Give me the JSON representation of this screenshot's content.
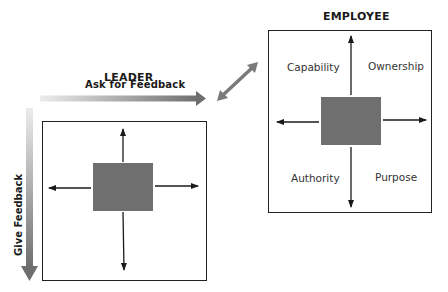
{
  "leader": {
    "title": "LEADER",
    "horizontal_arrow_label": "Ask for Feedback",
    "vertical_arrow_label": "Give Feedback"
  },
  "employee": {
    "title": "EMPLOYEE",
    "quadrants": {
      "top_left": "Capability",
      "top_right": "Ownership",
      "bottom_left": "Authority",
      "bottom_right": "Purpose"
    }
  },
  "colors": {
    "center_square": "#6f6f6f",
    "gradient_arrow_start": "#e6e6e6",
    "gradient_arrow_end": "#6e6e6e",
    "border": "#222222"
  }
}
